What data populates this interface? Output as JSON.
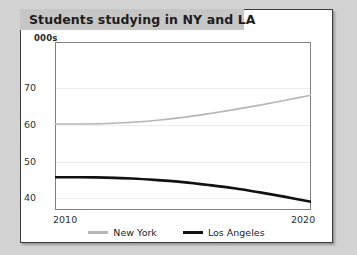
{
  "page": {
    "background_color": "#d2d2d2",
    "card_background": "#ffffff"
  },
  "title": {
    "text": "Students studying in NY and LA",
    "banner_color": "#c6c6c6"
  },
  "chart_data": {
    "type": "line",
    "title": "Students studying in NY and LA",
    "xlabel": "",
    "ylabel": "000s",
    "unit_label": "000s",
    "xlim": [
      2010,
      2020
    ],
    "ylim": [
      34,
      75
    ],
    "yticks": [
      40,
      50,
      60,
      70
    ],
    "xticks": [
      2010,
      2020
    ],
    "xtick_labels": [
      "2010",
      "2020"
    ],
    "ytick_labels": [
      "40",
      "50",
      "60",
      "70"
    ],
    "grid": true,
    "grid_color": "#ededed",
    "legend_position": "bottom",
    "x": [
      2010,
      2011,
      2012,
      2013,
      2014,
      2015,
      2016,
      2017,
      2018,
      2019,
      2020
    ],
    "series": [
      {
        "name": "New York",
        "color": "#b6b6b6",
        "width": 1.6,
        "values": [
          55.0,
          55.0,
          55.1,
          55.4,
          55.9,
          56.6,
          57.5,
          58.5,
          59.6,
          60.8,
          62.0
        ]
      },
      {
        "name": "Los Angeles",
        "color": "#111111",
        "width": 2.6,
        "values": [
          42.0,
          42.0,
          41.9,
          41.7,
          41.3,
          40.8,
          40.1,
          39.3,
          38.3,
          37.2,
          36.0
        ]
      }
    ]
  }
}
